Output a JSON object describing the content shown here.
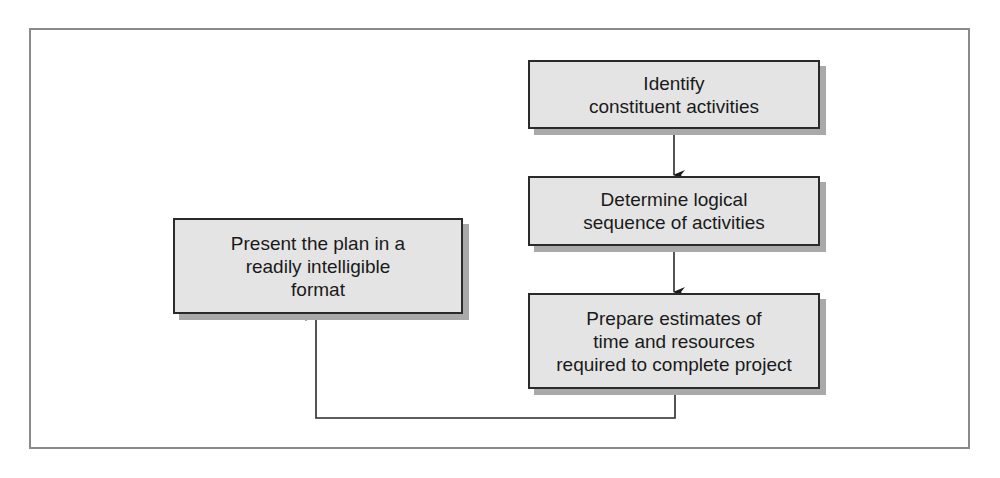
{
  "diagram": {
    "type": "flowchart",
    "nodes": [
      {
        "id": "identify",
        "label": "Identify\nconstituent activities"
      },
      {
        "id": "sequence",
        "label": "Determine logical\nsequence of activities"
      },
      {
        "id": "estimate",
        "label": "Prepare estimates of\ntime and resources\nrequired to complete project"
      },
      {
        "id": "present",
        "label": "Present the plan in a\nreadily intelligible\nformat"
      }
    ],
    "edges": [
      {
        "from": "identify",
        "to": "sequence"
      },
      {
        "from": "sequence",
        "to": "estimate"
      },
      {
        "from": "estimate",
        "to": "present"
      }
    ],
    "colors": {
      "box_fill": "#e4e4e4",
      "box_border": "#2a2a2a",
      "box_shadow": "#a9a9a9",
      "frame_border": "#8a8a8a",
      "line": "#2a2a2a"
    }
  }
}
